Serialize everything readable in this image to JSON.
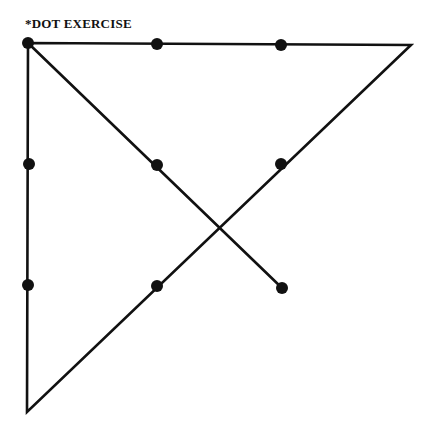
{
  "title": "*DOT EXERCISE",
  "colors": {
    "stroke": "#111111",
    "background": "#ffffff"
  },
  "dots": [
    {
      "x": 28,
      "y": 43
    },
    {
      "x": 157,
      "y": 44
    },
    {
      "x": 281,
      "y": 45
    },
    {
      "x": 29,
      "y": 164
    },
    {
      "x": 157,
      "y": 165
    },
    {
      "x": 281,
      "y": 164
    },
    {
      "x": 28,
      "y": 285
    },
    {
      "x": 157,
      "y": 286
    },
    {
      "x": 282,
      "y": 288
    }
  ],
  "path": [
    {
      "x": 282,
      "y": 288
    },
    {
      "x": 28,
      "y": 43
    },
    {
      "x": 411,
      "y": 45
    },
    {
      "x": 27,
      "y": 412
    },
    {
      "x": 28,
      "y": 43
    }
  ]
}
